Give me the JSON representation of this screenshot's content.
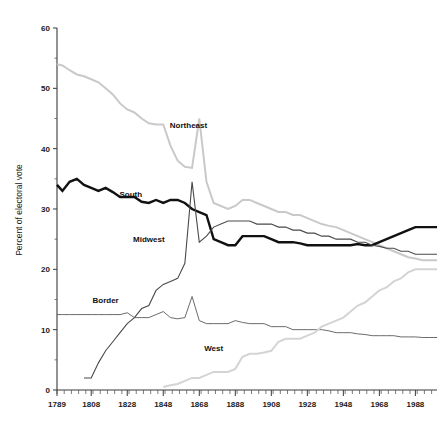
{
  "chart_data": {
    "type": "line",
    "title": "",
    "xlabel": "",
    "ylabel": "Percent of electoral vote",
    "xlim": [
      1789,
      2000
    ],
    "ylim": [
      0,
      60
    ],
    "grid": false,
    "legend_position": "inline-labels",
    "x_ticks": [
      1789,
      1808,
      1828,
      1848,
      1868,
      1888,
      1908,
      1928,
      1948,
      1968,
      1988
    ],
    "y_ticks": [
      0,
      10,
      20,
      30,
      40,
      50,
      60
    ],
    "x_minor_step": 4,
    "series": [
      {
        "name": "Northeast",
        "color": "#c9c9c9",
        "width": 2.0,
        "label_x": 1862,
        "label_y": 43.5,
        "x": [
          1789,
          1792,
          1796,
          1800,
          1804,
          1808,
          1812,
          1816,
          1820,
          1824,
          1828,
          1832,
          1836,
          1840,
          1844,
          1848,
          1852,
          1856,
          1860,
          1864,
          1868,
          1872,
          1876,
          1880,
          1884,
          1888,
          1892,
          1896,
          1900,
          1904,
          1908,
          1912,
          1916,
          1920,
          1924,
          1928,
          1932,
          1936,
          1940,
          1944,
          1948,
          1952,
          1956,
          1960,
          1964,
          1968,
          1972,
          1976,
          1980,
          1984,
          1988,
          1992,
          1996,
          2000
        ],
        "y": [
          54.0,
          53.8,
          53.0,
          52.3,
          52.0,
          51.5,
          51.0,
          50.0,
          49.0,
          47.5,
          46.5,
          46.0,
          45.0,
          44.2,
          44.0,
          44.0,
          40.5,
          38.0,
          37.0,
          36.8,
          45.0,
          34.5,
          31.0,
          30.5,
          30.0,
          30.5,
          31.5,
          31.5,
          31.0,
          30.5,
          30.0,
          29.5,
          29.5,
          29.0,
          29.0,
          28.5,
          28.0,
          27.5,
          27.2,
          27.0,
          26.5,
          26.0,
          25.5,
          25.0,
          24.5,
          24.0,
          23.5,
          23.0,
          22.5,
          22.0,
          21.8,
          21.5,
          21.5,
          21.5
        ]
      },
      {
        "name": "South",
        "color": "#111111",
        "width": 2.4,
        "label_x": 1830,
        "label_y": 32.0,
        "x": [
          1789,
          1792,
          1796,
          1800,
          1804,
          1808,
          1812,
          1816,
          1820,
          1824,
          1828,
          1832,
          1836,
          1840,
          1844,
          1848,
          1852,
          1856,
          1860,
          1864,
          1868,
          1872,
          1876,
          1880,
          1884,
          1888,
          1892,
          1896,
          1900,
          1904,
          1908,
          1912,
          1916,
          1920,
          1924,
          1928,
          1932,
          1936,
          1940,
          1944,
          1948,
          1952,
          1956,
          1960,
          1964,
          1968,
          1972,
          1976,
          1980,
          1984,
          1988,
          1992,
          1996,
          2000
        ],
        "y": [
          34.0,
          33.0,
          34.5,
          35.0,
          34.0,
          33.5,
          33.0,
          33.5,
          32.8,
          32.0,
          32.0,
          32.0,
          31.2,
          31.0,
          31.5,
          31.0,
          31.5,
          31.5,
          31.0,
          30.0,
          29.5,
          29.0,
          25.0,
          24.5,
          24.0,
          24.0,
          25.5,
          25.5,
          25.5,
          25.5,
          25.0,
          24.5,
          24.5,
          24.5,
          24.3,
          24.0,
          24.0,
          24.0,
          24.0,
          24.0,
          24.0,
          24.0,
          24.2,
          24.0,
          24.0,
          24.5,
          25.0,
          25.5,
          26.0,
          26.5,
          27.0,
          27.0,
          27.0,
          27.0
        ]
      },
      {
        "name": "Midwest",
        "color": "#4a4a4a",
        "width": 1.1,
        "label_x": 1840,
        "label_y": 24.5,
        "x": [
          1804,
          1808,
          1812,
          1816,
          1820,
          1824,
          1828,
          1832,
          1836,
          1840,
          1844,
          1848,
          1852,
          1856,
          1860,
          1864,
          1868,
          1872,
          1876,
          1880,
          1884,
          1888,
          1892,
          1896,
          1900,
          1904,
          1908,
          1912,
          1916,
          1920,
          1924,
          1928,
          1932,
          1936,
          1940,
          1944,
          1948,
          1952,
          1956,
          1960,
          1964,
          1968,
          1972,
          1976,
          1980,
          1984,
          1988,
          1992,
          1996,
          2000
        ],
        "y": [
          2.0,
          2.0,
          4.5,
          6.5,
          8.0,
          9.5,
          11.0,
          12.0,
          13.5,
          14.0,
          16.5,
          17.5,
          18.0,
          18.5,
          21.0,
          34.5,
          24.5,
          25.5,
          27.0,
          27.5,
          28.0,
          28.0,
          28.0,
          28.0,
          27.5,
          27.5,
          27.5,
          27.0,
          27.0,
          26.5,
          26.5,
          26.0,
          26.0,
          25.5,
          25.5,
          25.0,
          25.0,
          25.0,
          24.5,
          24.5,
          24.0,
          23.8,
          23.5,
          23.5,
          23.0,
          23.0,
          22.5,
          22.5,
          22.5,
          22.5
        ]
      },
      {
        "name": "Border",
        "color": "#5a5a5a",
        "width": 0.9,
        "label_x": 1816,
        "label_y": 14.5,
        "x": [
          1789,
          1792,
          1796,
          1800,
          1804,
          1808,
          1812,
          1816,
          1820,
          1824,
          1828,
          1832,
          1836,
          1840,
          1844,
          1848,
          1852,
          1856,
          1860,
          1864,
          1868,
          1872,
          1876,
          1880,
          1884,
          1888,
          1892,
          1896,
          1900,
          1904,
          1908,
          1912,
          1916,
          1920,
          1924,
          1928,
          1932,
          1936,
          1940,
          1944,
          1948,
          1952,
          1956,
          1960,
          1964,
          1968,
          1972,
          1976,
          1980,
          1984,
          1988,
          1992,
          1996,
          2000
        ],
        "y": [
          12.5,
          12.5,
          12.5,
          12.5,
          12.5,
          12.5,
          12.5,
          12.5,
          12.5,
          12.5,
          12.8,
          12.0,
          12.0,
          12.0,
          12.5,
          13.0,
          12.0,
          11.8,
          12.0,
          15.5,
          11.5,
          11.0,
          11.0,
          11.0,
          11.0,
          11.5,
          11.2,
          11.0,
          11.0,
          11.0,
          10.5,
          10.5,
          10.5,
          10.0,
          10.0,
          10.0,
          10.0,
          10.0,
          9.8,
          9.5,
          9.5,
          9.5,
          9.3,
          9.2,
          9.0,
          9.0,
          9.0,
          9.0,
          8.8,
          8.8,
          8.8,
          8.7,
          8.7,
          8.7
        ]
      },
      {
        "name": "West",
        "color": "#d4d4d4",
        "width": 2.0,
        "label_x": 1876,
        "label_y": 6.5,
        "x": [
          1848,
          1852,
          1856,
          1860,
          1864,
          1868,
          1872,
          1876,
          1880,
          1884,
          1888,
          1892,
          1896,
          1900,
          1904,
          1908,
          1912,
          1916,
          1920,
          1924,
          1928,
          1932,
          1936,
          1940,
          1944,
          1948,
          1952,
          1956,
          1960,
          1964,
          1968,
          1972,
          1976,
          1980,
          1984,
          1988,
          1992,
          1996,
          2000
        ],
        "y": [
          0.5,
          0.8,
          1.0,
          1.5,
          2.0,
          2.0,
          2.5,
          3.0,
          3.0,
          3.0,
          3.5,
          5.5,
          6.0,
          6.0,
          6.2,
          6.5,
          8.0,
          8.5,
          8.5,
          8.5,
          9.0,
          9.5,
          10.5,
          11.0,
          11.5,
          12.0,
          13.0,
          14.0,
          14.5,
          15.5,
          16.5,
          17.0,
          18.0,
          18.5,
          19.5,
          20.0,
          20.0,
          20.0,
          20.0
        ]
      }
    ]
  },
  "axis": {
    "y_label": "Percent of electoral vote",
    "y_tick_labels": [
      "0",
      "10",
      "20",
      "30",
      "40",
      "50",
      "60"
    ],
    "x_tick_labels": [
      "1789",
      "1808",
      "1828",
      "1848",
      "1868",
      "1888",
      "1908",
      "1928",
      "1948",
      "1968",
      "1988"
    ]
  },
  "labels": {
    "northeast": "Northeast",
    "south": "South",
    "midwest": "Midwest",
    "border": "Border",
    "west": "West"
  }
}
